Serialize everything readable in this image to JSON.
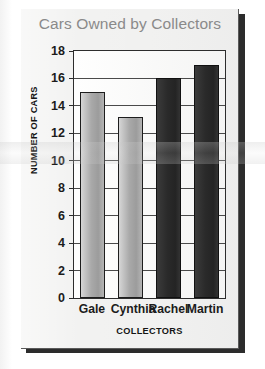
{
  "chart_data": {
    "type": "bar",
    "title": "Cars Owned by Collectors",
    "xlabel": "COLLECTORS",
    "ylabel": "NUMBER OF CARS",
    "categories": [
      "Gale",
      "Cynthia",
      "Rachel",
      "Martin"
    ],
    "values": [
      15,
      13.2,
      16,
      17
    ],
    "ylim": [
      0,
      18
    ],
    "ytick_step": 2,
    "yticks": [
      0,
      2,
      4,
      6,
      8,
      10,
      12,
      14,
      16,
      18
    ],
    "ytick_labels": [
      "0",
      "2",
      "4",
      "6",
      "8",
      "10",
      "12",
      "14",
      "16",
      "18"
    ],
    "grid": true,
    "grid_axis": "y",
    "legend": false,
    "bar_colors": [
      "#a9a9a9",
      "#a9a9a9",
      "#2a2a2a",
      "#2a2a2a"
    ],
    "series": [
      {
        "name": "Cars Owned",
        "values": [
          15,
          13.2,
          16,
          17
        ]
      }
    ]
  },
  "style": {
    "title_color": "#8a8a8a",
    "axis_color": "#2d2d2d",
    "label_color": "#1c1c1c",
    "panel_background": "#f1f1f0",
    "bar_light": "#a9a9a9",
    "bar_dark": "#2a2a2a"
  }
}
